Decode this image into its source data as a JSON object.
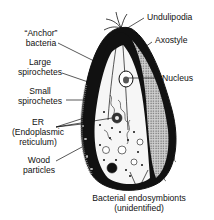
{
  "diagram": {
    "labels": {
      "undulipodia": "Undulipodia",
      "axostyle": "Axostyle",
      "nucleus": "Nucleus",
      "anchor_bacteria": [
        "“Anchor”",
        "bacteria"
      ],
      "large_spirochetes": [
        "Large",
        "spirochetes"
      ],
      "small_spirochetes": [
        "Small",
        "spirochetes"
      ],
      "er": [
        "ER",
        "(Endoplasmic",
        "reticulum)"
      ],
      "wood_particles": [
        "Wood",
        "particles"
      ],
      "bacterial_endosymbionts": [
        "Bacterial endosymbionts",
        "(unidentified)"
      ]
    },
    "colors": {
      "ink": "#111111",
      "background": "#ffffff",
      "cytoplasm": "#f2f2f2",
      "stipple": "#8a8a8a"
    }
  }
}
